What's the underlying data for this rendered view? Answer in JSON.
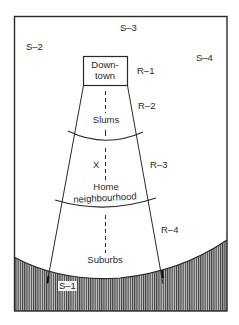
{
  "diagram": {
    "type": "urban-zone-model",
    "colors": {
      "line": "#2a2a2a",
      "hatch": "#3a3a3a",
      "background": "#ffffff"
    },
    "sectors": [
      {
        "id": "S-1",
        "label": "S–1"
      },
      {
        "id": "S-2",
        "label": "S–2"
      },
      {
        "id": "S-3",
        "label": "S–3"
      },
      {
        "id": "S-4",
        "label": "S–4"
      }
    ],
    "rings": [
      {
        "id": "R-1",
        "label": "R–1"
      },
      {
        "id": "R-2",
        "label": "R–2"
      },
      {
        "id": "R-3",
        "label": "R–3"
      },
      {
        "id": "R-4",
        "label": "R–4"
      }
    ],
    "zones": {
      "downtown_line1": "Down-",
      "downtown_line2": "town",
      "slums": "Slums",
      "home_marker": "X",
      "home_line1": "Home",
      "home_line2": "neighbourhood",
      "suburbs": "Suburbs"
    }
  }
}
